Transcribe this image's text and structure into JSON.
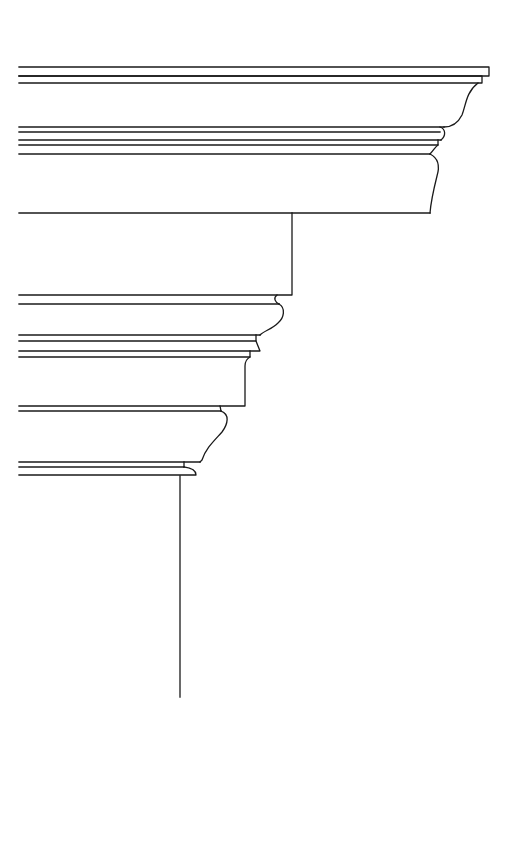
{
  "figure": {
    "title": "Entablature / cornice profile line drawing",
    "stroke_color": "#1a1a1a",
    "background": "#ffffff",
    "sections": [
      {
        "name": "cornice-crown",
        "top_y": 67,
        "bottom_y": 127
      },
      {
        "name": "cornice-bed-moldings",
        "top_y": 127,
        "bottom_y": 154
      },
      {
        "name": "frieze-fascia",
        "top_y": 154,
        "bottom_y": 213
      },
      {
        "name": "frieze-block",
        "top_y": 213,
        "bottom_y": 295
      },
      {
        "name": "architrave-upper",
        "top_y": 295,
        "bottom_y": 357
      },
      {
        "name": "architrave-middle",
        "top_y": 357,
        "bottom_y": 406
      },
      {
        "name": "capital-echinus",
        "top_y": 406,
        "bottom_y": 462
      },
      {
        "name": "capital-abacus",
        "top_y": 462,
        "bottom_y": 476
      },
      {
        "name": "shaft-line",
        "top_y": 476,
        "bottom_y": 697
      }
    ]
  }
}
